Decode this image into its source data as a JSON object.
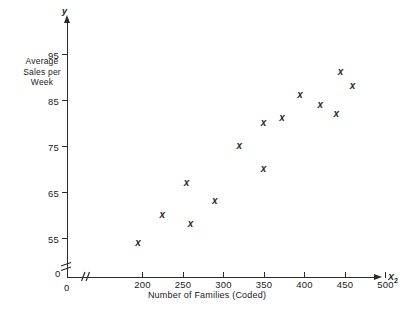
{
  "figure": {
    "background_color": "#ffffff",
    "ink_color": "#2b2b2b"
  },
  "axes": {
    "y_axis_name": "y",
    "x_axis_name": "X",
    "x_axis_name_subscript": "2",
    "y_origin_label": "0",
    "x_origin_label": "0",
    "y_caption_lines": [
      "Average",
      "Sales per",
      "Week"
    ],
    "x_caption": "Number of Families (Coded)",
    "y_ticks": [
      "55",
      "65",
      "75",
      "85",
      "95"
    ],
    "x_ticks": [
      "200",
      "250",
      "300",
      "350",
      "400",
      "450",
      "500"
    ],
    "axis_break_y": "double-slash-break",
    "axis_break_x": "double-slash-break"
  },
  "chart_data": {
    "type": "scatter",
    "title": "",
    "xlabel": "Number of Families (Coded)",
    "ylabel": "Average Sales per Week",
    "x_axis_symbol": "X2",
    "y_axis_symbol": "y",
    "xlim": [
      180,
      500
    ],
    "ylim": [
      50,
      98
    ],
    "x_ticks": [
      200,
      250,
      300,
      350,
      400,
      450,
      500
    ],
    "y_ticks": [
      55,
      65,
      75,
      85,
      95
    ],
    "grid": false,
    "legend": null,
    "marker": "x",
    "axis_break": true,
    "points": [
      {
        "x": 195,
        "y": 54
      },
      {
        "x": 225,
        "y": 60
      },
      {
        "x": 255,
        "y": 67
      },
      {
        "x": 260,
        "y": 58
      },
      {
        "x": 290,
        "y": 63
      },
      {
        "x": 320,
        "y": 75
      },
      {
        "x": 350,
        "y": 70
      },
      {
        "x": 350,
        "y": 80
      },
      {
        "x": 373,
        "y": 81
      },
      {
        "x": 395,
        "y": 86
      },
      {
        "x": 420,
        "y": 84
      },
      {
        "x": 440,
        "y": 82
      },
      {
        "x": 445,
        "y": 91
      },
      {
        "x": 460,
        "y": 88
      }
    ]
  }
}
